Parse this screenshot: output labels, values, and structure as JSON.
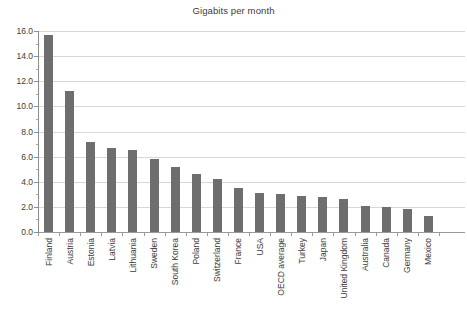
{
  "chart_data": {
    "type": "bar",
    "title": "Gigabits per month",
    "xlabel": "",
    "ylabel": "",
    "ylim": [
      0.0,
      16.0
    ],
    "ytick_step": 2.0,
    "yminor_step": 1.0,
    "grid": "horizontal",
    "legend": "none",
    "bar_color": "#6e6e6e",
    "gridline_color": "#d8d8d8",
    "axis_color": "#8d8d8d",
    "ytick_labels": [
      "16.0",
      "14.0",
      "12.0",
      "10.0",
      "8.0",
      "6.0",
      "4.0",
      "2.0",
      "0.0"
    ],
    "ytick_values": [
      16.0,
      14.0,
      12.0,
      10.0,
      8.0,
      6.0,
      4.0,
      2.0,
      0.0
    ],
    "categories": [
      "Finland",
      "Austria",
      "Estonia",
      "Latvia",
      "Lithuania",
      "Sweden",
      "South Korea",
      "Poland",
      "Switzerland",
      "France",
      "USA",
      "OECD average",
      "Turkey",
      "Japan",
      "United Kingdom",
      "Australia",
      "Canada",
      "Germany",
      "Mexico"
    ],
    "values": [
      15.7,
      11.2,
      7.2,
      6.7,
      6.5,
      5.8,
      5.2,
      4.6,
      4.2,
      3.5,
      3.1,
      3.0,
      2.9,
      2.8,
      2.6,
      2.1,
      2.0,
      1.8,
      1.3
    ]
  }
}
